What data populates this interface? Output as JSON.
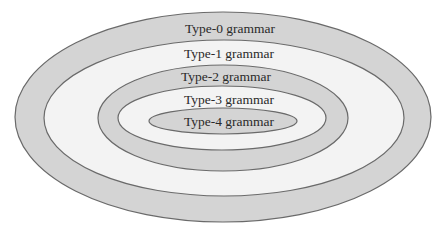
{
  "diagram": {
    "type": "nested-ellipses",
    "colors": {
      "gray_fill": "#d4d4d4",
      "light_fill": "#f3f3f3",
      "stroke": "#6a6a6a",
      "text": "#2a2a2a"
    },
    "levels": [
      {
        "label": "Type-0 grammar",
        "fill": "gray"
      },
      {
        "label": "Type-1 grammar",
        "fill": "light"
      },
      {
        "label": "Type-2 grammar",
        "fill": "gray"
      },
      {
        "label": "Type-3 grammar",
        "fill": "light"
      },
      {
        "label": "Type-4 grammar",
        "fill": "gray"
      }
    ]
  }
}
